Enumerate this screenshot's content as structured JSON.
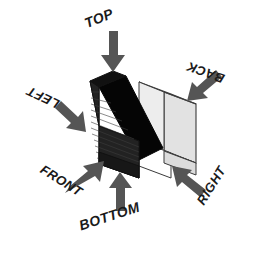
{
  "diagram": {
    "object_name": "isometric-bracket",
    "colors": {
      "background": "#ffffff",
      "arrow": "#555555",
      "label_text": "#1a1a1a",
      "face_dark": "#000000",
      "face_front": "#1c1c1c",
      "face_light": "#e8e8e8",
      "face_mid": "#d0d0d0",
      "outline": "#3a3a3a"
    },
    "labels": [
      {
        "id": "top",
        "text": "TOP",
        "rotation_deg": -22,
        "arrow_direction": "down"
      },
      {
        "id": "back",
        "text": "BACK",
        "rotation_deg": 200,
        "arrow_direction": "down-left"
      },
      {
        "id": "left",
        "text": "LEFT",
        "rotation_deg": 205,
        "arrow_direction": "down-right"
      },
      {
        "id": "front",
        "text": "FRONT",
        "rotation_deg": 32,
        "arrow_direction": "up-right"
      },
      {
        "id": "bottom",
        "text": "BOTTOM",
        "rotation_deg": -18,
        "arrow_direction": "up"
      },
      {
        "id": "right",
        "text": "RIGHT",
        "rotation_deg": -58,
        "arrow_direction": "up-left"
      }
    ]
  }
}
